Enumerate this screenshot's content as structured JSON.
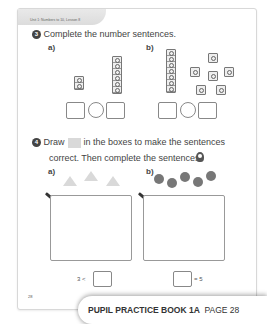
{
  "header": {
    "unit_label": "Unit 1: Numbers to 10, Lesson 8"
  },
  "q3": {
    "number": "3",
    "instruction": "Complete the number sentences.",
    "a": {
      "label": "a)",
      "left_stack_cubes": 2,
      "right_stack_cubes": 6
    },
    "b": {
      "label": "b)",
      "left_stack_cubes": 7,
      "right_single_cubes": 6
    }
  },
  "q4": {
    "number": "4",
    "instruction_part1": "Draw",
    "instruction_part2": "in the boxes to make the sentences",
    "instruction_line2": "correct. Then complete the sentences.",
    "hint_icon": "lightbulb-icon",
    "a": {
      "label": "a)",
      "shapes": "3 triangles",
      "sentence_left": "3 <"
    },
    "b": {
      "label": "b)",
      "shapes": "5 circles",
      "sentence_right": "= 5"
    }
  },
  "page_number": "28",
  "banner": {
    "title": "PUPIL PRACTICE BOOK 1A",
    "page": "PAGE 28"
  },
  "colors": {
    "swatch": "#d9d9d9",
    "dots": "#777777",
    "triangles": "#d9d9d9"
  }
}
